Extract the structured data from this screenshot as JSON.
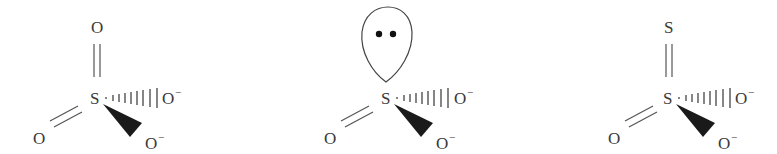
{
  "diagram": {
    "type": "molecular-structures",
    "structures": [
      {
        "id": "sulfate",
        "center_atom": "S",
        "top": {
          "atom": "O",
          "bond": "double"
        },
        "lower_left": {
          "atom": "O",
          "bond": "double"
        },
        "right": {
          "atom": "O",
          "charge": "−",
          "bond": "hashed-wedge"
        },
        "lower_right": {
          "atom": "O",
          "charge": "−",
          "bond": "solid-wedge"
        }
      },
      {
        "id": "sulfite",
        "center_atom": "S",
        "top": {
          "type": "lone-pair-lobe",
          "electrons": 2
        },
        "lower_left": {
          "atom": "O",
          "bond": "double"
        },
        "right": {
          "atom": "O",
          "charge": "−",
          "bond": "hashed-wedge"
        },
        "lower_right": {
          "atom": "O",
          "charge": "−",
          "bond": "solid-wedge"
        }
      },
      {
        "id": "thiosulfate",
        "center_atom": "S",
        "top": {
          "atom": "S",
          "bond": "double"
        },
        "lower_left": {
          "atom": "O",
          "bond": "double"
        },
        "right": {
          "atom": "O",
          "charge": "−",
          "bond": "hashed-wedge"
        },
        "lower_right": {
          "atom": "O",
          "charge": "−",
          "bond": "solid-wedge"
        }
      }
    ]
  },
  "labels": {
    "s1": {
      "center": "S",
      "top": "O",
      "left": "O",
      "right": "O",
      "right_charge": "−",
      "bottom": "O",
      "bottom_charge": "−"
    },
    "s2": {
      "center": "S",
      "left": "O",
      "right": "O",
      "right_charge": "−",
      "bottom": "O",
      "bottom_charge": "−"
    },
    "s3": {
      "center": "S",
      "top": "S",
      "left": "O",
      "right": "O",
      "right_charge": "−",
      "bottom": "O",
      "bottom_charge": "−"
    }
  }
}
